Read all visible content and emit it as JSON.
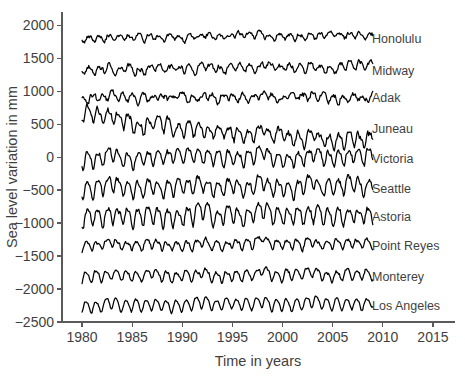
{
  "chart_data": {
    "type": "line",
    "title": "",
    "xlabel": "Time in years",
    "ylabel": "Sea level variation in mm",
    "xlim": [
      1978.0,
      2017.2
    ],
    "ylim": [
      -2500,
      2200
    ],
    "xticks": [
      1980,
      1985,
      1990,
      1995,
      2000,
      2005,
      2010,
      2015
    ],
    "xtick_labels": [
      "1980",
      "1985",
      "1990",
      "1995",
      "2000",
      "2005",
      "2010",
      "2015"
    ],
    "yticks": [
      2000,
      1500,
      1000,
      500,
      0,
      -500,
      -1000,
      -1500,
      -2000,
      -2500
    ],
    "ytick_labels": [
      "2000",
      "1500",
      "1000",
      "500",
      "0",
      "−500",
      "−1000",
      "−1500",
      "−2000",
      "−2500"
    ],
    "grid": false,
    "legend": "right-of-axes-inline",
    "line_color": "#000000",
    "data_start_year": 1980.0,
    "data_end_year": 2009.0,
    "samples_per_year": 12,
    "series": [
      {
        "name": "Honolulu",
        "label": "Honolulu",
        "offset": 1800,
        "label_y": 1800,
        "seasonal_amp": 38,
        "seasonal_phase": 0.55,
        "semiannual_amp": 12,
        "noise_amp": 46,
        "trend_per_year": 1.6,
        "enso_gain": 22,
        "seed": 11
      },
      {
        "name": "Midway",
        "label": "Midway",
        "offset": 1320,
        "label_y": 1320,
        "seasonal_amp": 52,
        "seasonal_phase": 0.5,
        "semiannual_amp": 16,
        "noise_amp": 58,
        "trend_per_year": 2.2,
        "enso_gain": 30,
        "seed": 23
      },
      {
        "name": "Adak",
        "label": "Adak",
        "offset": 900,
        "label_y": 900,
        "seasonal_amp": 48,
        "seasonal_phase": 0.2,
        "semiannual_amp": 14,
        "noise_amp": 62,
        "trend_per_year": 0.6,
        "enso_gain": 18,
        "seed": 37
      },
      {
        "name": "Juneau",
        "label": "Juneau",
        "offset": 430,
        "label_y": 430,
        "seasonal_amp": 95,
        "seasonal_phase": 0.62,
        "semiannual_amp": 28,
        "noise_amp": 78,
        "trend_per_year": -7.5,
        "start_bias": 225,
        "enso_gain": 70,
        "seed": 53
      },
      {
        "name": "Victoria",
        "label": "Victoria",
        "offset": -20,
        "label_y": -20,
        "seasonal_amp": 105,
        "seasonal_phase": 0.66,
        "semiannual_amp": 30,
        "noise_amp": 62,
        "trend_per_year": 0.9,
        "enso_gain": 78,
        "seed": 67
      },
      {
        "name": "Seattle",
        "label": "Seattle",
        "offset": -470,
        "label_y": -470,
        "seasonal_amp": 112,
        "seasonal_phase": 0.67,
        "semiannual_amp": 30,
        "noise_amp": 60,
        "trend_per_year": 1.1,
        "enso_gain": 82,
        "seed": 79
      },
      {
        "name": "Astoria",
        "label": "Astoria",
        "offset": -900,
        "label_y": -900,
        "seasonal_amp": 122,
        "seasonal_phase": 0.69,
        "semiannual_amp": 34,
        "noise_amp": 66,
        "trend_per_year": 0.4,
        "enso_gain": 86,
        "seed": 91
      },
      {
        "name": "Point Reyes",
        "label": "Point Reyes",
        "offset": -1340,
        "label_y": -1340,
        "seasonal_amp": 62,
        "seasonal_phase": 0.8,
        "semiannual_amp": 22,
        "noise_amp": 42,
        "trend_per_year": 1.2,
        "enso_gain": 58,
        "seed": 103
      },
      {
        "name": "Monterey",
        "label": "Monterey",
        "offset": -1810,
        "label_y": -1810,
        "seasonal_amp": 72,
        "seasonal_phase": 0.82,
        "semiannual_amp": 20,
        "noise_amp": 38,
        "trend_per_year": 1.0,
        "enso_gain": 58,
        "seed": 117
      },
      {
        "name": "Los Angeles",
        "label": "Los Angeles",
        "offset": -2250,
        "label_y": -2250,
        "seasonal_amp": 86,
        "seasonal_phase": 0.84,
        "semiannual_amp": 16,
        "noise_amp": 26,
        "trend_per_year": 1.0,
        "enso_gain": 52,
        "seed": 131
      }
    ],
    "enso_events": [
      {
        "year": 1982.9,
        "amp": 1.0,
        "width": 0.55
      },
      {
        "year": 1986.9,
        "amp": 0.45,
        "width": 0.5
      },
      {
        "year": 1991.9,
        "amp": 0.7,
        "width": 0.6
      },
      {
        "year": 1994.9,
        "amp": 0.45,
        "width": 0.45
      },
      {
        "year": 1997.9,
        "amp": 1.45,
        "width": 0.6
      },
      {
        "year": 2002.9,
        "amp": 0.85,
        "width": 0.55
      },
      {
        "year": 2006.8,
        "amp": 0.55,
        "width": 0.45
      },
      {
        "year": 2009.0,
        "amp": 0.4,
        "width": 0.4
      }
    ]
  },
  "geometry": {
    "plot_left": 62,
    "plot_right": 455,
    "plot_top": 12,
    "plot_bottom": 322,
    "label_x": 372,
    "tick_len": 5
  }
}
